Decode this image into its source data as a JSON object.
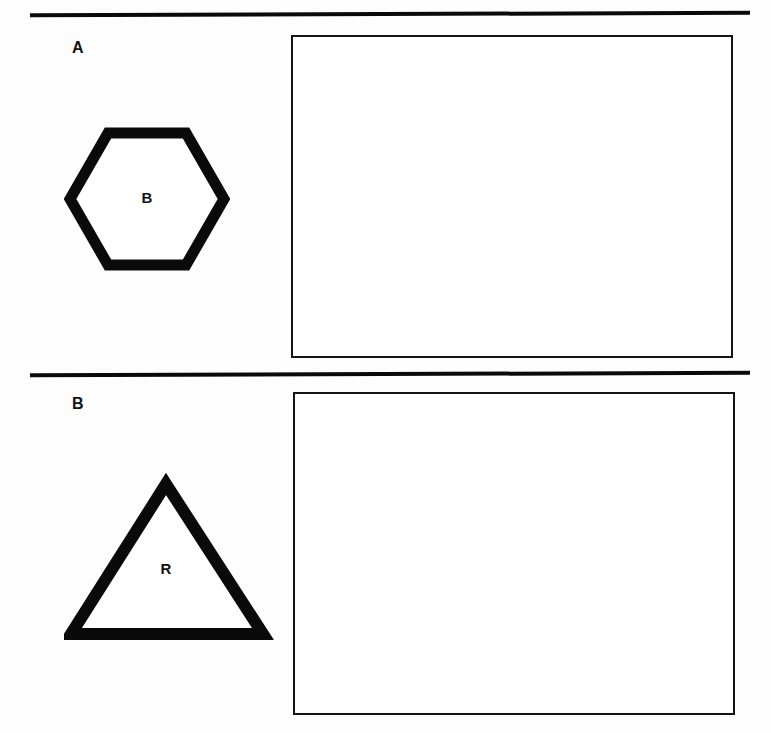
{
  "page": {
    "background_color": "#ffffff",
    "ink_color": "#111111",
    "width": 771,
    "height": 733
  },
  "dividers": [
    {
      "name": "top-rule"
    },
    {
      "name": "middle-rule"
    }
  ],
  "panels": [
    {
      "id": "A",
      "label": "A",
      "stimulus": {
        "shape": "hexagon",
        "letter": "B",
        "stroke_color": "#0a0a0a",
        "fill_color": "#ffffff",
        "orientation": "flat-top"
      },
      "answer_box": {
        "label": "",
        "border_color": "#141414",
        "fill_color": "#ffffff"
      }
    },
    {
      "id": "B",
      "label": "B",
      "stimulus": {
        "shape": "triangle",
        "letter": "R",
        "stroke_color": "#0a0a0a",
        "fill_color": "#ffffff",
        "orientation": "apex-up"
      },
      "answer_box": {
        "label": "",
        "border_color": "#141414",
        "fill_color": "#ffffff"
      }
    }
  ]
}
